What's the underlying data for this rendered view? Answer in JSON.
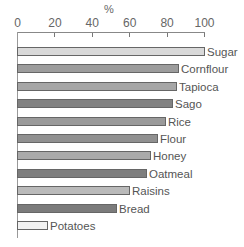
{
  "chart_data": {
    "type": "bar",
    "orientation": "horizontal",
    "title": "",
    "xlabel": "%",
    "ylabel": "",
    "xlim": [
      0,
      100
    ],
    "xticks": [
      "0",
      "20",
      "40",
      "60",
      "80",
      "100"
    ],
    "axis_position": "top",
    "grid": false,
    "legend": null,
    "categories": [
      "Sugar",
      "Cornflour",
      "Tapioca",
      "Sago",
      "Rice",
      "Flour",
      "Honey",
      "Oatmeal",
      "Raisins",
      "Bread",
      "Potatoes"
    ],
    "values": [
      100,
      86,
      85,
      83,
      79,
      75,
      71,
      69,
      60,
      53,
      16
    ],
    "colors": [
      "#d9d9d9",
      "#9c9c9c",
      "#a6a6a6",
      "#828282",
      "#9a9a9a",
      "#909090",
      "#aaaaaa",
      "#7e7e7e",
      "#bababa",
      "#7b7b7b",
      "#f2f2f2"
    ]
  }
}
